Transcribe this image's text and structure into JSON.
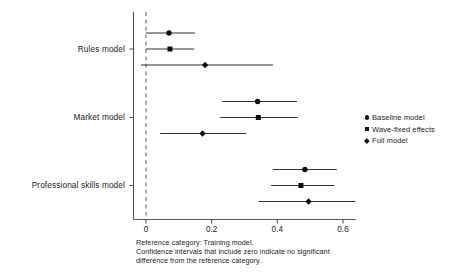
{
  "chart_data": {
    "type": "scatter",
    "subtype": "forest-plot",
    "title": "",
    "xlabel": "",
    "ylabel": "",
    "xlim": [
      -0.04,
      0.66
    ],
    "ylim_categories": [
      "Rules model",
      "Market model",
      "Professional skills model"
    ],
    "xticks": [
      0,
      0.2,
      0.4,
      0.6
    ],
    "xtick_labels": [
      "0",
      "0.2",
      "0.4",
      "0.6"
    ],
    "grid": false,
    "reference_line": 0,
    "legend_position": "right",
    "legend": [
      {
        "label": "Baseline model",
        "marker": "circle"
      },
      {
        "label": "Wave-fixed effects",
        "marker": "square"
      },
      {
        "label": "Full model",
        "marker": "diamond"
      }
    ],
    "categories": [
      "Rules model",
      "Market model",
      "Professional skills model"
    ],
    "series": [
      {
        "name": "Baseline model",
        "marker": "circle",
        "estimates": [
          0.07,
          0.34,
          0.484
        ],
        "ci_low": [
          0.0,
          0.232,
          0.386
        ],
        "ci_high": [
          0.149,
          0.46,
          0.581
        ]
      },
      {
        "name": "Wave-fixed effects",
        "marker": "square",
        "estimates": [
          0.073,
          0.342,
          0.472
        ],
        "ci_low": [
          0.0,
          0.226,
          0.381
        ],
        "ci_high": [
          0.147,
          0.461,
          0.574
        ]
      },
      {
        "name": "Full model",
        "marker": "diamond",
        "estimates": [
          0.18,
          0.172,
          0.495
        ],
        "ci_low": [
          -0.015,
          0.043,
          0.343
        ],
        "ci_high": [
          0.387,
          0.305,
          0.637
        ]
      }
    ]
  },
  "footnote": {
    "line1": "Reference category: Training model.",
    "line2": "Confidence intervals that include zero indicate no significant",
    "line3": "difference from the reference category."
  }
}
